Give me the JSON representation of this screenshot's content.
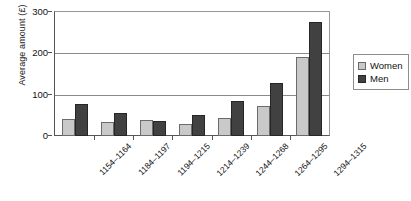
{
  "chart_data": {
    "type": "bar",
    "title": "",
    "subtitle": "",
    "xlabel": "",
    "ylabel": "Average amount (£)",
    "ylim": [
      0,
      300
    ],
    "yticks": [
      0,
      100,
      200,
      300
    ],
    "ytick_labels": [
      "0",
      "100",
      "200",
      "300"
    ],
    "grid": "horizontal",
    "legend_position": "right",
    "categories": [
      "1154–1164",
      "1184–1197",
      "1194–1215",
      "1214–1239",
      "1244–1268",
      "1264–1295",
      "1294–1315"
    ],
    "series": [
      {
        "name": "Women",
        "color": "#c9c9c9",
        "values": [
          40,
          33,
          38,
          30,
          43,
          72,
          190
        ]
      },
      {
        "name": "Men",
        "color": "#414141",
        "values": [
          77,
          55,
          37,
          50,
          85,
          128,
          277
        ]
      }
    ]
  },
  "legend": {
    "entries": [
      {
        "label": "Women",
        "swatch": "women-swatch-icon"
      },
      {
        "label": "Men",
        "swatch": "men-swatch-icon"
      }
    ]
  }
}
